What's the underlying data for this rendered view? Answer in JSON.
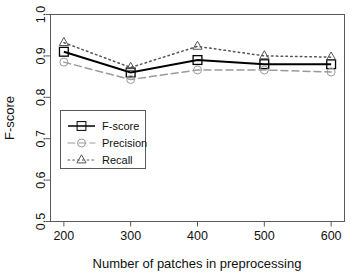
{
  "chart_data": {
    "type": "line",
    "title": "",
    "xlabel": "Number of patches in preprocessing",
    "ylabel": "F-score",
    "x": [
      200,
      300,
      400,
      500,
      600
    ],
    "categories": [
      "200",
      "300",
      "400",
      "500",
      "600"
    ],
    "xtick_labels": [
      "200",
      "300",
      "400",
      "500",
      "600"
    ],
    "ytick_labels": [
      "0.5",
      "0.6",
      "0.7",
      "0.8",
      "0.9",
      "1.0"
    ],
    "ytick_values": [
      0.5,
      0.6,
      0.7,
      0.8,
      0.9,
      1.0
    ],
    "xlim": [
      180,
      620
    ],
    "ylim": [
      0.5,
      1.0
    ],
    "grid": false,
    "legend_position": "center-left",
    "series": [
      {
        "name": "F-score",
        "values": [
          0.91,
          0.86,
          0.89,
          0.88,
          0.88
        ],
        "line_style": "solid",
        "marker": "square",
        "color": "#000000"
      },
      {
        "name": "Precision",
        "values": [
          0.885,
          0.843,
          0.866,
          0.866,
          0.861
        ],
        "line_style": "dashed",
        "marker": "circle",
        "color": "#9a9a9a"
      },
      {
        "name": "Recall",
        "values": [
          0.932,
          0.872,
          0.923,
          0.9,
          0.897
        ],
        "line_style": "dotted",
        "marker": "triangle",
        "color": "#555555"
      }
    ]
  },
  "legend": {
    "entries": [
      {
        "label": "F-score"
      },
      {
        "label": "Precision"
      },
      {
        "label": "Recall"
      }
    ]
  },
  "axes": {
    "x_title": "Number of patches in preprocessing",
    "y_title": "F-score"
  }
}
